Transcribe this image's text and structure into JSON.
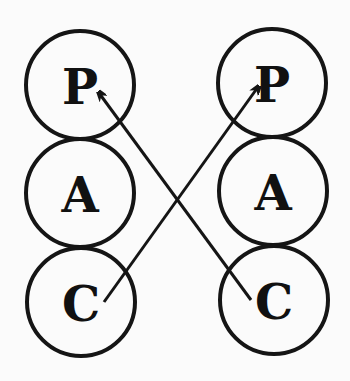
{
  "diagram": {
    "type": "transactional-analysis-crossed-transaction",
    "colors": {
      "ink": "#151515",
      "background": "#fbfbfb"
    },
    "left_column": {
      "states": [
        {
          "label": "P",
          "cx": 80,
          "cy": 85,
          "r": 54
        },
        {
          "label": "A",
          "cx": 80,
          "cy": 193,
          "r": 54
        },
        {
          "label": "C",
          "cx": 81,
          "cy": 302,
          "r": 54
        }
      ]
    },
    "right_column": {
      "states": [
        {
          "label": "P",
          "cx": 272,
          "cy": 83,
          "r": 54
        },
        {
          "label": "A",
          "cx": 273,
          "cy": 191,
          "r": 54
        },
        {
          "label": "C",
          "cx": 274,
          "cy": 300,
          "r": 54
        }
      ]
    },
    "arrows": [
      {
        "from": "left.C",
        "to": "right.P",
        "x1": 104,
        "y1": 302,
        "x2": 258,
        "y2": 87
      },
      {
        "from": "right.C",
        "to": "left.P",
        "x1": 251,
        "y1": 300,
        "x2": 99,
        "y2": 93
      }
    ]
  }
}
